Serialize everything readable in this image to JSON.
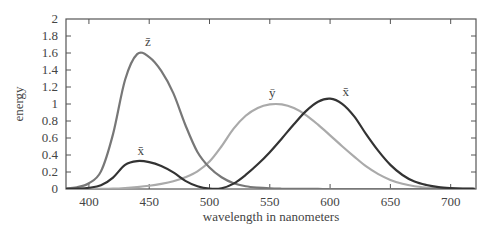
{
  "chart_data": {
    "type": "line",
    "title": "",
    "xlabel": "wavelength in nanometers",
    "ylabel": "energy",
    "xlim": [
      381,
      721
    ],
    "ylim": [
      0,
      2
    ],
    "grid": false,
    "legend_position": "inline labels",
    "x_ticks": [
      400,
      450,
      500,
      550,
      600,
      650,
      700
    ],
    "y_ticks": [
      0,
      0.2,
      0.4,
      0.6,
      0.8,
      1,
      1.2,
      1.4,
      1.6,
      1.8,
      2
    ],
    "y_tick_labels": [
      "0",
      "0.2",
      "0.4",
      "0.6",
      "0.8",
      "1",
      "1.2",
      "1.4",
      "1.6",
      "1.8",
      "2"
    ],
    "x": [
      380,
      390,
      400,
      410,
      420,
      430,
      440,
      450,
      460,
      470,
      480,
      490,
      500,
      510,
      520,
      530,
      540,
      550,
      560,
      570,
      580,
      590,
      600,
      610,
      620,
      630,
      640,
      650,
      660,
      670,
      680,
      690,
      700,
      710,
      720
    ],
    "series": [
      {
        "name": "x̄",
        "label": "x̄",
        "color": "#333333",
        "values": [
          0.0014,
          0.0042,
          0.0143,
          0.0435,
          0.1344,
          0.2839,
          0.3283,
          0.3162,
          0.2708,
          0.1954,
          0.0956,
          0.032,
          0.0049,
          0.0093,
          0.0633,
          0.1655,
          0.2904,
          0.4334,
          0.5945,
          0.7621,
          0.9163,
          1.0263,
          1.0622,
          1.0026,
          0.8544,
          0.6424,
          0.4479,
          0.2835,
          0.1649,
          0.0874,
          0.0468,
          0.0227,
          0.0114,
          0.0058,
          0.0029
        ]
      },
      {
        "name": "ȳ",
        "label": "ȳ",
        "color": "#aaaaaa",
        "values": [
          0.0,
          0.0001,
          0.0004,
          0.0012,
          0.004,
          0.0116,
          0.023,
          0.038,
          0.06,
          0.091,
          0.139,
          0.208,
          0.323,
          0.503,
          0.71,
          0.862,
          0.954,
          0.995,
          0.995,
          0.952,
          0.87,
          0.757,
          0.631,
          0.503,
          0.381,
          0.265,
          0.175,
          0.107,
          0.061,
          0.032,
          0.017,
          0.0082,
          0.0041,
          0.0021,
          0.001
        ]
      },
      {
        "name": "z̄",
        "label": "z̄",
        "color": "#777777",
        "values": [
          0.0065,
          0.0201,
          0.0679,
          0.2074,
          0.6456,
          1.2856,
          1.5871,
          1.5521,
          1.3892,
          1.1276,
          0.753,
          0.4352,
          0.252,
          0.1382,
          0.0682,
          0.0322,
          0.0153,
          0.0067,
          0.0029,
          0.0011,
          0.0007,
          0.0003,
          0.0002,
          0.0001,
          0,
          0,
          0,
          0,
          0,
          0,
          0,
          0,
          0,
          0,
          0
        ]
      }
    ],
    "annotations": [
      {
        "text": "z̄",
        "x": 449,
        "y": 1.68
      },
      {
        "text": "x̄",
        "x": 443,
        "y": 0.4
      },
      {
        "text": "ȳ",
        "x": 552,
        "y": 1.08
      },
      {
        "text": "x̄",
        "x": 613,
        "y": 1.1
      }
    ]
  }
}
